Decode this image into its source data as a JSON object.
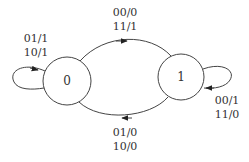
{
  "diagram": {
    "type": "finite-state-machine",
    "colors": {
      "stroke": "#444444",
      "text": "#333333",
      "background": "#ffffff"
    },
    "states": [
      {
        "id": "s0",
        "label": "0"
      },
      {
        "id": "s1",
        "label": "1"
      }
    ],
    "transitions": [
      {
        "from": "0",
        "to": "0",
        "labels": [
          "01/1",
          "10/1"
        ]
      },
      {
        "from": "0",
        "to": "1",
        "labels": [
          "00/0",
          "11/1"
        ]
      },
      {
        "from": "1",
        "to": "1",
        "labels": [
          "00/1",
          "11/0"
        ]
      },
      {
        "from": "1",
        "to": "0",
        "labels": [
          "01/0",
          "10/0"
        ]
      }
    ]
  }
}
